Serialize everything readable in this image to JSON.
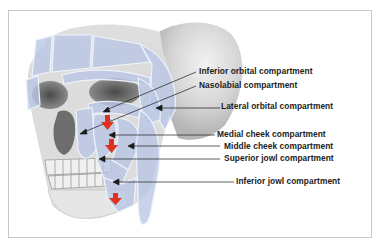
{
  "figure": {
    "labels": [
      {
        "id": "inferior-orbital",
        "text": "Inferior orbital compartment"
      },
      {
        "id": "nasolabial",
        "text": "Nasolabial compartment"
      },
      {
        "id": "lateral-orbital",
        "text": "Lateral orbital compartment"
      },
      {
        "id": "medial-cheek",
        "text": "Medial cheek compartment"
      },
      {
        "id": "middle-cheek",
        "text": "Middle cheek compartment"
      },
      {
        "id": "superior-jowl",
        "text": "Superior jowl compartment"
      },
      {
        "id": "inferior-jowl",
        "text": "Inferior jowl compartment"
      }
    ],
    "indicators": [
      {
        "name": "descent-arrow-orbital",
        "icon": "red-down-arrow-icon"
      },
      {
        "name": "descent-arrow-cheek",
        "icon": "red-down-arrow-icon"
      },
      {
        "name": "descent-arrow-jowl",
        "icon": "red-down-arrow-icon"
      }
    ],
    "colors": {
      "compartment_fill": "#b9c6e6",
      "compartment_stroke": "#eef2fb",
      "bone": "#d9d9d9",
      "bone_shadow": "#6a6a6a",
      "arrow_red": "#e0301e",
      "leader_line": "#1a1a1a",
      "frame_border": "#c8c8c8"
    }
  }
}
